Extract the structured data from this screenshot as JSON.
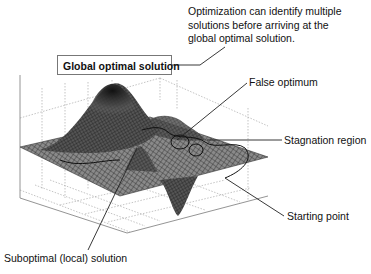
{
  "diagram": {
    "type": "3D optimization landscape surface plot with annotations",
    "note": {
      "line1": "Optimization can identify multiple",
      "line2": "solutions before arriving at the",
      "line3": "global optimal solution."
    },
    "labels": {
      "global": "Global optimal solution",
      "false_optimum": "False optimum",
      "stagnation": "Stagnation region",
      "starting_point": "Starting point",
      "suboptimal": "Suboptimal (local) solution"
    },
    "colors": {
      "surface_dark": "#1a1a1a",
      "surface_mid": "#6a6a6a",
      "grid": "#aaaaaa",
      "leader": "#222222"
    }
  }
}
